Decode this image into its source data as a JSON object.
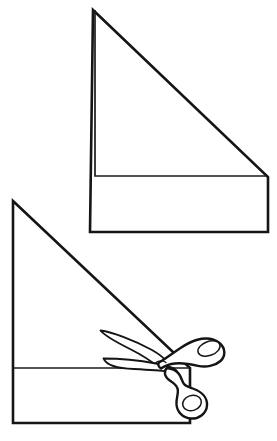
{
  "figure": {
    "type": "line-art-diagram",
    "panel_count": 2,
    "background_color": "#ffffff",
    "ink_color": "#151515",
    "width": 277,
    "height": 441
  },
  "panels": [
    {
      "id": "top-panel",
      "name": "folded-paper-before-cut",
      "caption": "",
      "shape_name": "right-triangle-over-rectangle",
      "apex": {
        "x": 93,
        "y": 10
      },
      "outline_points": "93,10 268,177 268,232 90,232",
      "fold_line_points": "95,10 95,176 268,176",
      "fold_line_label": "",
      "has_scissors": false
    },
    {
      "id": "bottom-panel",
      "name": "folded-paper-being-cut",
      "caption": "",
      "shape_name": "right-triangle-over-rectangle-with-scissors",
      "apex": {
        "x": 13,
        "y": 201
      },
      "outline_points": "13,201 190,368 190,423 13,423",
      "fold_line_points": "13,368 190,368",
      "fold_line_label": "",
      "has_scissors": true,
      "scissors": {
        "name": "scissors",
        "orientation": "pointing-left",
        "blade_tip": {
          "x": 100,
          "y": 331
        },
        "pivot": {
          "x": 163,
          "y": 362
        },
        "upper_handle_loop": {
          "cx": 209,
          "cy": 348,
          "rx": 11,
          "ry": 7
        },
        "lower_handle_loop": {
          "cx": 201,
          "cy": 403,
          "rx": 9,
          "ry": 7
        },
        "blade_count": 2
      }
    }
  ],
  "labels": {
    "annotations": []
  }
}
